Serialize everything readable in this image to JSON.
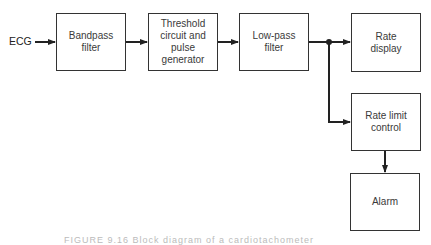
{
  "diagram": {
    "input_label": "ECG",
    "blocks": [
      {
        "id": "bandpass",
        "label_lines": [
          "Bandpass",
          "filter"
        ]
      },
      {
        "id": "threshold",
        "label_lines": [
          "Threshold",
          "circuit and",
          "pulse",
          "generator"
        ]
      },
      {
        "id": "lowpass",
        "label_lines": [
          "Low-pass",
          "filter"
        ]
      },
      {
        "id": "rate_display",
        "label_lines": [
          "Rate",
          "display"
        ]
      },
      {
        "id": "rate_limit",
        "label_lines": [
          "Rate limit",
          "control"
        ]
      },
      {
        "id": "alarm",
        "label_lines": [
          "Alarm"
        ]
      }
    ],
    "connections": [
      {
        "from": "ECG",
        "to": "bandpass"
      },
      {
        "from": "bandpass",
        "to": "threshold"
      },
      {
        "from": "threshold",
        "to": "lowpass"
      },
      {
        "from": "lowpass",
        "to": "rate_display"
      },
      {
        "from": "lowpass",
        "to": "rate_limit"
      },
      {
        "from": "rate_limit",
        "to": "alarm"
      }
    ],
    "caption": "FIGURE 9.16  Block diagram of a cardiotachometer"
  },
  "colors": {
    "line": "#222222",
    "box_border": "#333333",
    "text": "#3a3a3a"
  }
}
